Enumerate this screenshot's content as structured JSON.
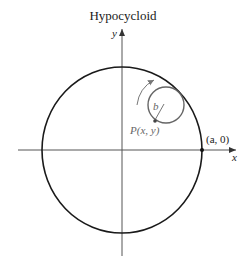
{
  "title": "Hypocycloid",
  "axes": {
    "x_label": "x",
    "y_label": "y"
  },
  "labels": {
    "point_p": "P(x, y)",
    "point_a": "(a, 0)",
    "radius_b": "b"
  },
  "colors": {
    "fixed_circle": "#1a1a1a",
    "rolling_circle": "#666666",
    "axes": "#555555",
    "arrow": "#777777"
  },
  "geometry": {
    "fixed_circle_radius_label": "a",
    "rolling_circle_radius_label": "b"
  }
}
